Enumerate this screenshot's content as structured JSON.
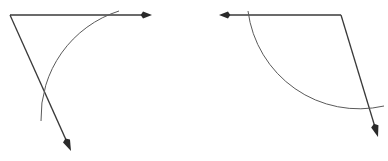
{
  "canvas": {
    "width": 388,
    "height": 161,
    "background_color": "#ffffff"
  },
  "style": {
    "ray_color": "#3a3a3a",
    "ray_width": 1.3,
    "arc_color": "#5a5a5a",
    "arc_width": 1.0,
    "arrow_color": "#2a2a2a"
  },
  "figures": [
    {
      "id": "left-figure",
      "name": "angle-diagram-left",
      "description": "Angle opening rightward and downward from a vertex at upper left, with two arrow-tipped rays and an arc mark crossing both rays",
      "vertex": {
        "x": 10,
        "y": 15
      },
      "rays": [
        {
          "id": "left-ray-horizontal",
          "name": "horizontal-ray-right",
          "direction": "right",
          "from": {
            "x": 10,
            "y": 15
          },
          "to": {
            "x": 152,
            "y": 15
          },
          "arrow_at": "end"
        },
        {
          "id": "left-ray-slanted",
          "name": "slanted-ray-down-right",
          "direction": "down-right",
          "from": {
            "x": 10,
            "y": 15
          },
          "to": {
            "x": 71,
            "y": 151
          },
          "arrow_at": "end"
        }
      ],
      "arc": {
        "id": "left-arc",
        "name": "angle-arc-mark",
        "start": {
          "x": 119,
          "y": 11
        },
        "end": {
          "x": 41,
          "y": 121
        },
        "radius": 112,
        "sweep": 0,
        "large_arc": 0
      }
    },
    {
      "id": "right-figure",
      "name": "angle-diagram-right",
      "description": "Mirrored angle with a leftward arrow ray along the top and a downward-right arrow ray from the top right corner, with an arc mark crossing both rays",
      "vertex": {
        "x": 341,
        "y": 15
      },
      "rays": [
        {
          "id": "right-ray-horizontal",
          "name": "horizontal-ray-left",
          "direction": "left",
          "from": {
            "x": 341,
            "y": 15
          },
          "to": {
            "x": 219,
            "y": 15
          },
          "arrow_at": "end"
        },
        {
          "id": "right-ray-slanted",
          "name": "slanted-ray-down-right",
          "direction": "down-right",
          "from": {
            "x": 341,
            "y": 15
          },
          "to": {
            "x": 378,
            "y": 137
          },
          "arrow_at": "end"
        }
      ],
      "arc": {
        "id": "right-arc",
        "name": "angle-arc-mark",
        "start": {
          "x": 248,
          "y": 11
        },
        "end": {
          "x": 384,
          "y": 106
        },
        "radius": 112,
        "sweep": 0,
        "large_arc": 0
      }
    }
  ]
}
